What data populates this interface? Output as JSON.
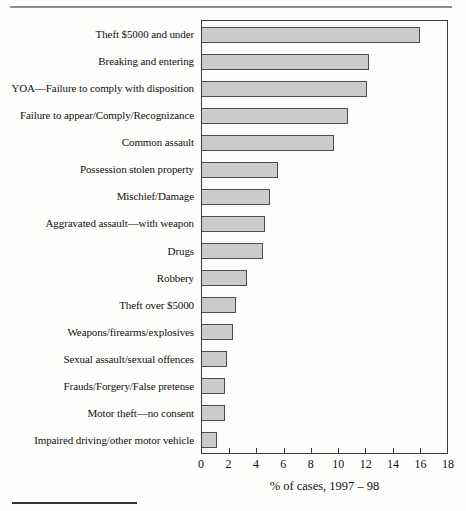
{
  "chart_data": {
    "type": "bar",
    "orientation": "horizontal",
    "title": "",
    "xlabel": "% of cases, 1997 – 98",
    "ylabel": "",
    "xlim": [
      0,
      18
    ],
    "xticks": [
      0,
      2,
      4,
      6,
      8,
      10,
      12,
      14,
      16,
      18
    ],
    "grid": false,
    "legend": "none",
    "bar_color": "#cbcbcb",
    "bar_border_color": "#4d4d4d",
    "categories": [
      "Theft $5000 and under",
      "Breaking and entering",
      "YOA—Failure to comply with disposition",
      "Failure to appear/Comply/Recognizance",
      "Common assault",
      "Possession stolen property",
      "Mischief/Damage",
      "Aggravated assault—with weapon",
      "Drugs",
      "Robbery",
      "Theft over $5000",
      "Weapons/firearms/explosives",
      "Sexual assault/sexual offences",
      "Frauds/Forgery/False pretense",
      "Motor theft—no consent",
      "Impaired driving/other motor vehicle"
    ],
    "values": [
      16,
      12.3,
      12.1,
      10.7,
      9.7,
      5.6,
      5,
      4.6,
      4.5,
      3.3,
      2.5,
      2.3,
      1.8,
      1.7,
      1.7,
      1.1
    ]
  }
}
